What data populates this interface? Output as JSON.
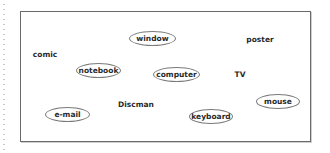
{
  "diagram": {
    "plain_words": [
      {
        "id": "comic",
        "label": "comic"
      },
      {
        "id": "poster",
        "label": "poster"
      },
      {
        "id": "tv",
        "label": "TV"
      },
      {
        "id": "discman",
        "label": "Discman"
      }
    ],
    "circled_words": [
      {
        "id": "window",
        "label": "window"
      },
      {
        "id": "notebook",
        "label": "notebook"
      },
      {
        "id": "computer",
        "label": "computer"
      },
      {
        "id": "e-mail",
        "label": "e-mail"
      },
      {
        "id": "mouse",
        "label": "mouse"
      },
      {
        "id": "keyboard",
        "label": "keyboard"
      }
    ]
  }
}
